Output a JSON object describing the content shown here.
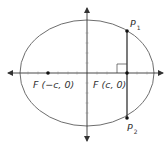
{
  "diagram": {
    "type": "ellipse-latus-rectum",
    "colors": {
      "ellipse": "#6e6e6e",
      "axes": "#333333",
      "segment": "#333333",
      "points": "#111111",
      "text": "#333333"
    },
    "labels": {
      "left_focus": "F (−c, 0)",
      "right_focus": "F (c, 0)",
      "p1": "P",
      "p1_sub": "1",
      "p2": "P",
      "p2_sub": "2"
    },
    "elements": {
      "ellipse": {
        "cx": 87,
        "cy": 73,
        "rx": 67,
        "ry": 53
      },
      "x_axis": {
        "from": 8,
        "to": 163,
        "y": 73
      },
      "y_axis": {
        "x": 87,
        "from": 8,
        "to": 140
      },
      "left_focus_point": {
        "x": 48,
        "y": 73
      },
      "right_focus_point": {
        "x": 127,
        "y": 73
      },
      "p1_point": {
        "x": 127,
        "y": 31
      },
      "p2_point": {
        "x": 127,
        "y": 118
      },
      "right_angle_marker": {
        "x": 117,
        "y": 64,
        "size": 9
      }
    }
  }
}
